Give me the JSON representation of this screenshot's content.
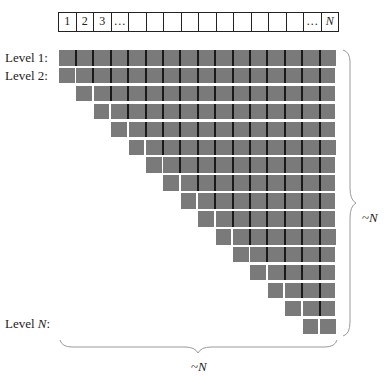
{
  "diagram": {
    "top_array": {
      "cells": [
        "1",
        "2",
        "3",
        "…",
        "",
        "",
        "",
        "",
        "",
        "",
        "",
        "",
        "",
        "",
        "…",
        "N"
      ],
      "italic_indices": [
        15
      ]
    },
    "levels": {
      "count": 16,
      "labels": [
        {
          "text": "Level 1:",
          "row": 0
        },
        {
          "text": "Level 2:",
          "row": 1
        },
        {
          "text": "Level N:",
          "row": 15
        }
      ]
    },
    "grid": {
      "columns": 16,
      "rows": 16,
      "cell_color": "#7a7a7a",
      "separator_color": "#1a1a1a",
      "gap_color": "#ffffff"
    },
    "braces": {
      "right_label": "~N",
      "bottom_label": "~N"
    }
  }
}
